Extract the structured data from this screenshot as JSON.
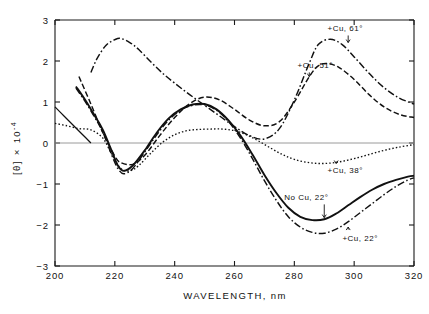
{
  "chart_data": {
    "type": "line",
    "title": "",
    "xlabel": "WAVELENGTH, nm",
    "ylabel": "[θ] × 10⁻⁴",
    "ylabel_parts": {
      "bracket": "[θ]",
      "times": "×",
      "power": "10",
      "exponent": "-4"
    },
    "xlim": [
      200,
      320
    ],
    "ylim": [
      -3,
      3
    ],
    "grid": false,
    "legend_position": "inline-annotations",
    "xticks": [
      200,
      220,
      240,
      260,
      280,
      300,
      320
    ],
    "xticklabels": [
      "200",
      "220",
      "240",
      "260",
      "280",
      "300",
      "320"
    ],
    "yticks": [
      -3,
      -2,
      -1,
      0,
      1,
      2,
      3
    ],
    "yticklabels": [
      "−3",
      "−2",
      "−1",
      "0",
      "1",
      "2",
      "3"
    ],
    "zero_reference_line": 0,
    "series": [
      {
        "name": "+Cu, 61°",
        "style": "dash-dot",
        "annotation": "+Cu, 61°",
        "x": [
          212,
          214,
          217,
          220,
          222,
          225,
          228,
          232,
          236,
          240,
          245,
          250,
          255,
          260,
          265,
          270,
          275,
          280,
          285,
          288,
          292,
          296,
          300,
          305,
          310,
          315,
          320
        ],
        "y": [
          1.72,
          2.05,
          2.38,
          2.52,
          2.55,
          2.45,
          2.28,
          1.98,
          1.7,
          1.46,
          1.18,
          0.92,
          0.66,
          0.4,
          0.18,
          0.1,
          0.35,
          1.05,
          1.95,
          2.4,
          2.53,
          2.4,
          2.1,
          1.7,
          1.35,
          1.1,
          0.95
        ]
      },
      {
        "name": "+Cu, 51°",
        "style": "dashed",
        "annotation": "+Cu, 51°",
        "x": [
          208,
          212,
          216,
          220,
          222,
          226,
          230,
          235,
          240,
          245,
          250,
          255,
          260,
          265,
          270,
          275,
          280,
          285,
          288,
          291,
          295,
          300,
          305,
          310,
          315,
          320
        ],
        "y": [
          1.62,
          0.95,
          0.25,
          -0.32,
          -0.48,
          -0.52,
          -0.3,
          0.18,
          0.62,
          0.96,
          1.12,
          1.05,
          0.82,
          0.56,
          0.42,
          0.52,
          1.0,
          1.62,
          1.88,
          1.94,
          1.84,
          1.55,
          1.18,
          0.88,
          0.7,
          0.62
        ]
      },
      {
        "name": "+Cu, 38°",
        "style": "dotted",
        "annotation": "+Cu, 38°",
        "x": [
          200,
          204,
          208,
          212,
          216,
          219,
          222,
          225,
          228,
          232,
          236,
          240,
          244,
          248,
          252,
          256,
          260,
          264,
          268,
          272,
          276,
          280,
          285,
          290,
          295,
          300,
          305,
          310,
          315,
          320
        ],
        "y": [
          0.48,
          0.42,
          0.35,
          0.32,
          0.12,
          -0.28,
          -0.62,
          -0.68,
          -0.55,
          -0.25,
          0.02,
          0.2,
          0.3,
          0.33,
          0.34,
          0.34,
          0.3,
          0.2,
          0.05,
          -0.12,
          -0.28,
          -0.4,
          -0.48,
          -0.5,
          -0.46,
          -0.38,
          -0.28,
          -0.18,
          -0.1,
          -0.04
        ]
      },
      {
        "name": "No Cu, 22°",
        "style": "solid",
        "annotation": "No Cu, 22°",
        "x": [
          207,
          210,
          213,
          216,
          219,
          221,
          223,
          226,
          230,
          234,
          238,
          242,
          246,
          250,
          254,
          258,
          262,
          266,
          270,
          274,
          278,
          282,
          286,
          290,
          294,
          298,
          302,
          306,
          310,
          314,
          318,
          320
        ],
        "y": [
          1.38,
          1.06,
          0.7,
          0.32,
          -0.2,
          -0.55,
          -0.68,
          -0.55,
          -0.18,
          0.25,
          0.6,
          0.82,
          0.94,
          0.95,
          0.82,
          0.55,
          0.18,
          -0.28,
          -0.78,
          -1.22,
          -1.58,
          -1.8,
          -1.88,
          -1.86,
          -1.72,
          -1.52,
          -1.32,
          -1.14,
          -1.0,
          -0.9,
          -0.82,
          -0.8
        ]
      },
      {
        "name": "+Cu, 22°",
        "style": "dash-dot-thin",
        "annotation": "+Cu, 22°",
        "x": [
          207,
          210,
          213,
          216,
          219,
          221,
          223,
          226,
          230,
          234,
          238,
          242,
          246,
          250,
          254,
          258,
          262,
          266,
          270,
          274,
          278,
          282,
          286,
          290,
          294,
          298,
          302,
          306,
          310,
          314,
          318,
          320
        ],
        "y": [
          1.34,
          1.02,
          0.66,
          0.26,
          -0.3,
          -0.62,
          -0.75,
          -0.62,
          -0.22,
          0.2,
          0.56,
          0.8,
          0.92,
          0.93,
          0.8,
          0.52,
          0.12,
          -0.38,
          -0.92,
          -1.4,
          -1.8,
          -2.05,
          -2.18,
          -2.2,
          -2.1,
          -1.92,
          -1.7,
          -1.48,
          -1.26,
          -1.06,
          -0.9,
          -0.85
        ]
      },
      {
        "name": "rising-short-left",
        "style": "thin",
        "annotation": "",
        "x": [
          200,
          203,
          206,
          209,
          212
        ],
        "y": [
          0.88,
          0.66,
          0.44,
          0.22,
          0.0
        ]
      }
    ],
    "annotations": [
      {
        "text": "+Cu, 61°",
        "x": 297,
        "y": 2.72,
        "arrow_to_x": 298,
        "arrow_to_y": 2.45
      },
      {
        "text": "+Cu, 51°",
        "x": 287,
        "y": 1.82,
        "arrow_to_x": 285,
        "arrow_to_y": 1.62
      },
      {
        "text": "+Cu, 38°",
        "x": 297,
        "y": -0.72,
        "arrow_to_x": 294,
        "arrow_to_y": -0.5
      },
      {
        "text": "No Cu, 22°",
        "x": 284,
        "y": -1.4,
        "arrow_to_x": 290,
        "arrow_to_y": -1.82
      },
      {
        "text": "+Cu, 22°",
        "x": 302,
        "y": -2.38,
        "arrow_to_x": 298,
        "arrow_to_y": -2.05
      }
    ]
  },
  "figure": {
    "xlabel": "WAVELENGTH, nm",
    "ylabel_bracket": "[θ]",
    "ylabel_times": "×",
    "ylabel_base": "10",
    "ylabel_exp": "-4"
  }
}
